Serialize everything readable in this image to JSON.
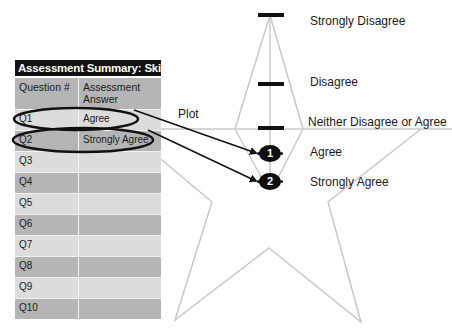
{
  "table": {
    "title": "Assessment Summary: Skills",
    "headers": [
      "Question #",
      "Assessment Answer"
    ],
    "rows": [
      {
        "question": "Q1",
        "answer": "Agree"
      },
      {
        "question": "Q2",
        "answer": "Strongly Agree"
      },
      {
        "question": "Q3",
        "answer": ""
      },
      {
        "question": "Q4",
        "answer": ""
      },
      {
        "question": "Q5",
        "answer": ""
      },
      {
        "question": "Q6",
        "answer": ""
      },
      {
        "question": "Q7",
        "answer": ""
      },
      {
        "question": "Q8",
        "answer": ""
      },
      {
        "question": "Q9",
        "answer": ""
      },
      {
        "question": "Q10",
        "answer": ""
      }
    ]
  },
  "annotation": {
    "plot_label": "Plot"
  },
  "scale": {
    "levels": [
      "Strongly Disagree",
      "Disagree",
      "Neither Disagree or Agree",
      "Agree",
      "Strongly Agree"
    ]
  },
  "markers": [
    {
      "number": "1",
      "level": "Agree"
    },
    {
      "number": "2",
      "level": "Strongly Agree"
    }
  ],
  "colors": {
    "title_bg": "#111111",
    "row_dark": "#b5b5b5",
    "row_light": "#dcdcdc",
    "star_line": "#c8c8c8",
    "marker": "#0e0e0e"
  }
}
